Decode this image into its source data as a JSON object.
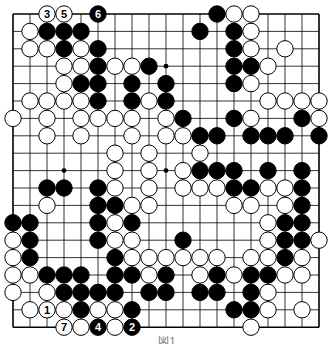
{
  "diagram": {
    "type": "go-board",
    "size": 19,
    "colors": {
      "black": "#000000",
      "white": "#ffffff",
      "line": "#000000",
      "background": "#ffffff"
    },
    "hoshi": [
      [
        3,
        3
      ],
      [
        3,
        9
      ],
      [
        9,
        3
      ],
      [
        9,
        9
      ]
    ],
    "stones": {
      "black": [
        [
          0,
          5
        ],
        [
          0,
          12
        ],
        [
          1,
          2
        ],
        [
          1,
          3
        ],
        [
          1,
          4
        ],
        [
          1,
          11
        ],
        [
          1,
          13
        ],
        [
          2,
          3
        ],
        [
          2,
          5
        ],
        [
          2,
          13
        ],
        [
          3,
          5
        ],
        [
          3,
          8
        ],
        [
          3,
          13
        ],
        [
          3,
          14
        ],
        [
          4,
          4
        ],
        [
          4,
          5
        ],
        [
          4,
          7
        ],
        [
          4,
          9
        ],
        [
          4,
          13
        ],
        [
          5,
          5
        ],
        [
          5,
          7
        ],
        [
          5,
          9
        ],
        [
          6,
          10
        ],
        [
          6,
          13
        ],
        [
          6,
          17
        ],
        [
          7,
          11
        ],
        [
          7,
          12
        ],
        [
          7,
          14
        ],
        [
          7,
          15
        ],
        [
          7,
          16
        ],
        [
          7,
          18
        ],
        [
          9,
          11
        ],
        [
          9,
          12
        ],
        [
          9,
          13
        ],
        [
          9,
          15
        ],
        [
          9,
          17
        ],
        [
          10,
          2
        ],
        [
          10,
          3
        ],
        [
          10,
          5
        ],
        [
          10,
          13
        ],
        [
          10,
          14
        ],
        [
          10,
          17
        ],
        [
          11,
          5
        ],
        [
          11,
          6
        ],
        [
          11,
          17
        ],
        [
          12,
          0
        ],
        [
          12,
          1
        ],
        [
          12,
          5
        ],
        [
          12,
          7
        ],
        [
          12,
          16
        ],
        [
          12,
          17
        ],
        [
          13,
          1
        ],
        [
          13,
          5
        ],
        [
          13,
          10
        ],
        [
          13,
          16
        ],
        [
          13,
          17
        ],
        [
          14,
          1
        ],
        [
          14,
          6
        ],
        [
          14,
          16
        ],
        [
          15,
          2
        ],
        [
          15,
          3
        ],
        [
          15,
          4
        ],
        [
          15,
          6
        ],
        [
          15,
          7
        ],
        [
          15,
          9
        ],
        [
          15,
          12
        ],
        [
          15,
          14
        ],
        [
          15,
          15
        ],
        [
          16,
          3
        ],
        [
          16,
          4
        ],
        [
          16,
          5
        ],
        [
          16,
          6
        ],
        [
          16,
          8
        ],
        [
          16,
          9
        ],
        [
          16,
          11
        ],
        [
          16,
          12
        ],
        [
          16,
          14
        ],
        [
          17,
          4
        ],
        [
          17,
          7
        ],
        [
          17,
          13
        ],
        [
          17,
          14
        ],
        [
          18,
          5
        ],
        [
          18,
          7
        ]
      ],
      "white": [
        [
          0,
          2
        ],
        [
          0,
          3
        ],
        [
          0,
          13
        ],
        [
          0,
          14
        ],
        [
          1,
          1
        ],
        [
          1,
          14
        ],
        [
          2,
          1
        ],
        [
          2,
          2
        ],
        [
          2,
          4
        ],
        [
          2,
          14
        ],
        [
          2,
          16
        ],
        [
          3,
          3
        ],
        [
          3,
          4
        ],
        [
          3,
          6
        ],
        [
          3,
          7
        ],
        [
          3,
          15
        ],
        [
          4,
          3
        ],
        [
          4,
          14
        ],
        [
          5,
          1
        ],
        [
          5,
          2
        ],
        [
          5,
          3
        ],
        [
          5,
          4
        ],
        [
          5,
          8
        ],
        [
          5,
          15
        ],
        [
          5,
          16
        ],
        [
          5,
          17
        ],
        [
          5,
          18
        ],
        [
          6,
          0
        ],
        [
          6,
          2
        ],
        [
          6,
          4
        ],
        [
          6,
          5
        ],
        [
          6,
          6
        ],
        [
          6,
          7
        ],
        [
          6,
          9
        ],
        [
          6,
          14
        ],
        [
          6,
          18
        ],
        [
          7,
          2
        ],
        [
          7,
          4
        ],
        [
          7,
          7
        ],
        [
          7,
          9
        ],
        [
          7,
          10
        ],
        [
          8,
          6
        ],
        [
          8,
          8
        ],
        [
          8,
          11
        ],
        [
          9,
          6
        ],
        [
          9,
          8
        ],
        [
          9,
          10
        ],
        [
          10,
          6
        ],
        [
          10,
          8
        ],
        [
          10,
          10
        ],
        [
          10,
          11
        ],
        [
          10,
          12
        ],
        [
          10,
          15
        ],
        [
          10,
          16
        ],
        [
          11,
          2
        ],
        [
          11,
          7
        ],
        [
          11,
          8
        ],
        [
          11,
          13
        ],
        [
          11,
          14
        ],
        [
          11,
          16
        ],
        [
          12,
          6
        ],
        [
          12,
          15
        ],
        [
          13,
          0
        ],
        [
          13,
          6
        ],
        [
          13,
          7
        ],
        [
          13,
          15
        ],
        [
          13,
          18
        ],
        [
          14,
          0
        ],
        [
          14,
          7
        ],
        [
          14,
          8
        ],
        [
          14,
          9
        ],
        [
          14,
          10
        ],
        [
          14,
          11
        ],
        [
          14,
          12
        ],
        [
          14,
          14
        ],
        [
          14,
          15
        ],
        [
          14,
          17
        ],
        [
          15,
          0
        ],
        [
          15,
          1
        ],
        [
          15,
          8
        ],
        [
          15,
          11
        ],
        [
          15,
          13
        ],
        [
          15,
          16
        ],
        [
          15,
          17
        ],
        [
          16,
          0
        ],
        [
          16,
          2
        ],
        [
          16,
          15
        ],
        [
          17,
          1
        ],
        [
          17,
          2
        ],
        [
          17,
          3
        ],
        [
          17,
          5
        ],
        [
          17,
          6
        ],
        [
          17,
          15
        ],
        [
          17,
          17
        ],
        [
          18,
          3
        ],
        [
          18,
          4
        ],
        [
          18,
          6
        ],
        [
          18,
          14
        ]
      ]
    },
    "numbered_moves": [
      {
        "label": "1",
        "color": "white",
        "row": 17,
        "col": 2
      },
      {
        "label": "2",
        "color": "black",
        "row": 18,
        "col": 7
      },
      {
        "label": "3",
        "color": "white",
        "row": 0,
        "col": 2
      },
      {
        "label": "4",
        "color": "black",
        "row": 18,
        "col": 5
      },
      {
        "label": "5",
        "color": "white",
        "row": 0,
        "col": 3
      },
      {
        "label": "6",
        "color": "black",
        "row": 0,
        "col": 5
      },
      {
        "label": "7",
        "color": "white",
        "row": 18,
        "col": 3
      }
    ],
    "caption": "図1"
  }
}
